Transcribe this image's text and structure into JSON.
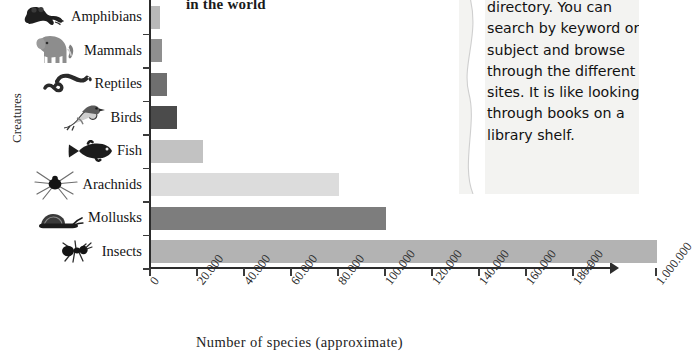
{
  "chart_data": {
    "type": "bar",
    "orientation": "horizontal",
    "title": "in the world",
    "xlabel": "Number of species (approximate)",
    "ylabel": "Creatures",
    "categories": [
      "Amphibians",
      "Mammals",
      "Reptiles",
      "Birds",
      "Fish",
      "Arachnids",
      "Mollusks",
      "Insects"
    ],
    "values": [
      4000,
      4500,
      7000,
      11000,
      22000,
      80000,
      100000,
      1000000
    ],
    "value_labels": [
      "4.000",
      "4.500",
      "7.000",
      "11.000",
      "22.000",
      "80.000",
      "100.000",
      "1.000.000"
    ],
    "icons": [
      "frog-icon",
      "elephant-icon",
      "snake-icon",
      "bird-icon",
      "fish-icon",
      "spider-icon",
      "snail-icon",
      "ant-icon"
    ],
    "bar_colors": [
      "#b9b9b9",
      "#8f8f8f",
      "#6f6f6f",
      "#4b4b4b",
      "#c2c2c2",
      "#dcdcdc",
      "#7d7d7d",
      "#b3b3b3"
    ],
    "xticks": [
      "0",
      "20.000",
      "40.000",
      "60.000",
      "80.000",
      "100.000",
      "120.000",
      "140.000",
      "160.000",
      "180.000",
      "1.000.000"
    ],
    "xtick_values": [
      0,
      20000,
      40000,
      60000,
      80000,
      100000,
      120000,
      140000,
      160000,
      180000,
      1000000
    ],
    "xlim": [
      0,
      200000
    ],
    "axis_break": true,
    "axis_break_symbol": "//",
    "grid": false,
    "legend": "none"
  },
  "side_panel": {
    "paragraph": "directory. You can search by keyword or subject and browse through the different sites. It is like looking through books on a library shelf.",
    "background_color": "#f3f3f1"
  }
}
